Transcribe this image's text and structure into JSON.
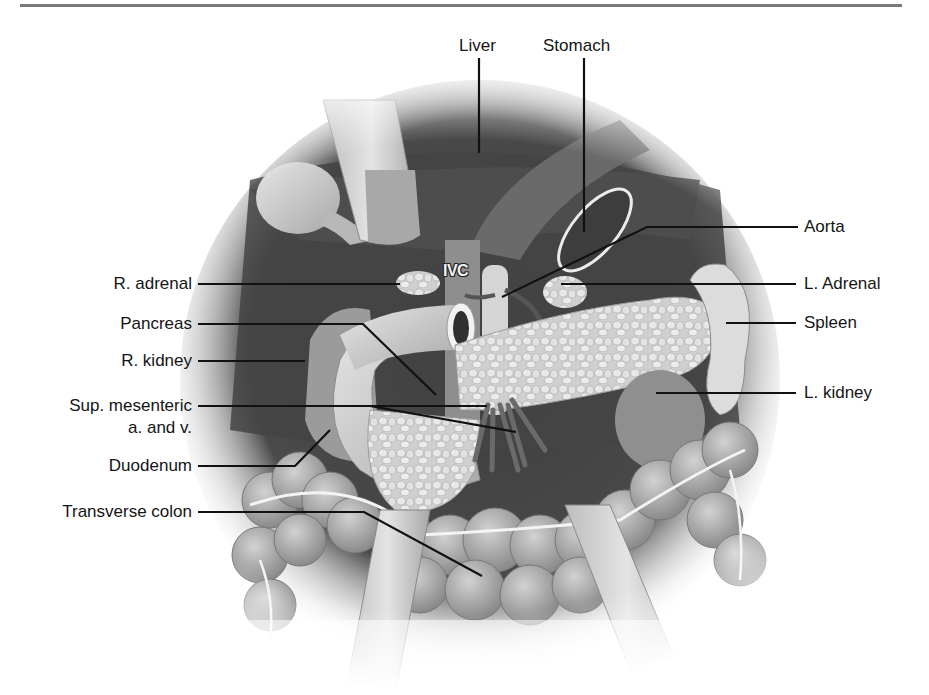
{
  "figure": {
    "type": "anatomical-illustration",
    "colors": {
      "rule": "#7a7a7a",
      "background": "#ffffff",
      "dark_cavity": "#3a3a3a",
      "tissue_light": "#d8d8d8",
      "leader_line": "#111111"
    }
  },
  "labels": {
    "top": {
      "liver": "Liver",
      "stomach": "Stomach"
    },
    "left": {
      "r_adrenal": "R. adrenal",
      "pancreas": "Pancreas",
      "r_kidney": "R. kidney",
      "sup_mesenteric_line1": "Sup. mesenteric",
      "sup_mesenteric_line2": "a. and v.",
      "duodenum": "Duodenum",
      "transverse_colon": "Transverse colon"
    },
    "right": {
      "aorta": "Aorta",
      "l_adrenal": "L. Adrenal",
      "spleen": "Spleen",
      "l_kidney": "L. kidney"
    },
    "inline": {
      "ivc": "IVC"
    }
  }
}
